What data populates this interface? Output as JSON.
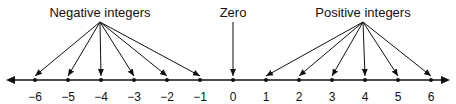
{
  "diagram": {
    "title_labels": {
      "negative": "Negative integers",
      "zero": "Zero",
      "positive": "Positive integers"
    },
    "ticks": [
      {
        "value": -6,
        "label": "−6"
      },
      {
        "value": -5,
        "label": "−5"
      },
      {
        "value": -4,
        "label": "−4"
      },
      {
        "value": -3,
        "label": "−3"
      },
      {
        "value": -2,
        "label": "−2"
      },
      {
        "value": -1,
        "label": "−1"
      },
      {
        "value": 0,
        "label": "0"
      },
      {
        "value": 1,
        "label": "1"
      },
      {
        "value": 2,
        "label": "2"
      },
      {
        "value": 3,
        "label": "3"
      },
      {
        "value": 4,
        "label": "4"
      },
      {
        "value": 5,
        "label": "5"
      },
      {
        "value": 6,
        "label": "6"
      }
    ],
    "colors": {
      "line": "#111111",
      "text": "#111111",
      "background": "#ffffff"
    }
  }
}
